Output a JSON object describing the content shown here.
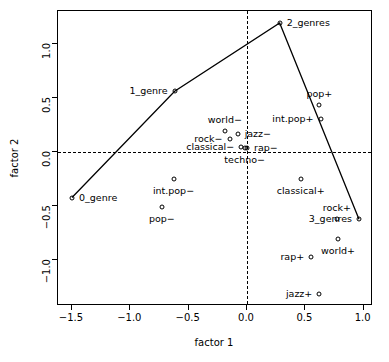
{
  "chart_data": {
    "type": "scatter",
    "title": "",
    "xlabel": "factor 1",
    "ylabel": "factor 2",
    "xlim": [
      -1.62,
      1.08
    ],
    "ylim": [
      -1.42,
      1.3
    ],
    "xticks": [
      -1.5,
      -1.0,
      -0.5,
      0.0,
      0.5,
      1.0
    ],
    "xticklabels": [
      "-1.5",
      "-1.0",
      "-0.5",
      "0.0",
      "0.5",
      "1.0"
    ],
    "yticks": [
      -1.0,
      -0.5,
      0.0,
      0.5,
      1.0
    ],
    "yticklabels": [
      "-1.0",
      "-0.5",
      "0.0",
      "0.5",
      "1.0"
    ],
    "grid": false,
    "legend": null,
    "reference_lines": [
      {
        "axis": "y",
        "value": 0.0,
        "style": "dashed"
      },
      {
        "axis": "x",
        "value": 0.0,
        "style": "dashed"
      }
    ],
    "marker": "open-circle",
    "points": [
      {
        "label": "0_genre",
        "x": -1.5,
        "y": -0.42,
        "pos": "right"
      },
      {
        "label": "1_genre",
        "x": -0.62,
        "y": 0.56,
        "pos": "left"
      },
      {
        "label": "2_genres",
        "x": 0.28,
        "y": 1.19,
        "pos": "right"
      },
      {
        "label": "3_genres",
        "x": 0.96,
        "y": -0.62,
        "pos": "left"
      },
      {
        "label": "pop-",
        "x": -0.73,
        "y": -0.51,
        "pos": "below"
      },
      {
        "label": "int.pop-",
        "x": -0.63,
        "y": -0.25,
        "pos": "below"
      },
      {
        "label": "world-",
        "x": -0.19,
        "y": 0.19,
        "pos": "above"
      },
      {
        "label": "rock-",
        "x": -0.15,
        "y": 0.12,
        "pos": "left"
      },
      {
        "label": "jazz-",
        "x": -0.08,
        "y": 0.17,
        "pos": "right"
      },
      {
        "label": "classical-",
        "x": -0.05,
        "y": 0.05,
        "pos": "left"
      },
      {
        "label": "techno-",
        "x": -0.02,
        "y": 0.04,
        "pos": "below"
      },
      {
        "label": "rap-",
        "x": 0.0,
        "y": 0.04,
        "pos": "right"
      },
      {
        "label": "classical+",
        "x": 0.46,
        "y": -0.25,
        "pos": "below"
      },
      {
        "label": "rap+",
        "x": 0.55,
        "y": -0.97,
        "pos": "left"
      },
      {
        "label": "jazz+",
        "x": 0.62,
        "y": -1.31,
        "pos": "left"
      },
      {
        "label": "pop+",
        "x": 0.62,
        "y": 0.43,
        "pos": "above"
      },
      {
        "label": "int.pop+",
        "x": 0.63,
        "y": 0.3,
        "pos": "left"
      },
      {
        "label": "rock+",
        "x": 0.77,
        "y": -0.62,
        "pos": "above"
      },
      {
        "label": "world+",
        "x": 0.78,
        "y": -0.8,
        "pos": "below"
      }
    ],
    "path": {
      "name": "genre-count-trajectory",
      "points": [
        {
          "label": "0_genre",
          "x": -1.5,
          "y": -0.42
        },
        {
          "label": "1_genre",
          "x": -0.62,
          "y": 0.56
        },
        {
          "label": "2_genres",
          "x": 0.28,
          "y": 1.19
        },
        {
          "label": "3_genres",
          "x": 0.96,
          "y": -0.62
        }
      ],
      "style": "solid",
      "color": "#000000"
    }
  }
}
